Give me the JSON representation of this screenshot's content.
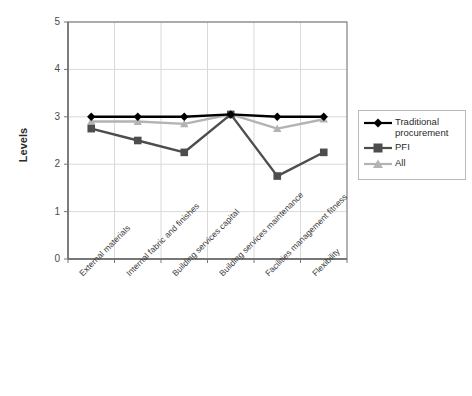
{
  "chart_data": {
    "type": "line",
    "title": "",
    "xlabel": "",
    "ylabel": "Levels",
    "ylim": [
      0,
      5
    ],
    "yticks": [
      "0",
      "1",
      "2",
      "3",
      "4",
      "5"
    ],
    "grid": true,
    "legend_position": "right",
    "categories": [
      "External materials",
      "Internal fabric and finishes",
      "Building services capital",
      "Building services maintenance",
      "Facilities management fitness",
      "Flexibility"
    ],
    "series": [
      {
        "name": "Traditional procurement",
        "marker": "diamond",
        "color": "#000000",
        "values": [
          3.0,
          3.0,
          3.0,
          3.05,
          3.0,
          3.0
        ]
      },
      {
        "name": "PFI",
        "marker": "square",
        "color": "#4d4d4d",
        "values": [
          2.75,
          2.5,
          2.25,
          3.05,
          1.75,
          2.25
        ]
      },
      {
        "name": "All",
        "marker": "triangle",
        "color": "#b3b3b3",
        "values": [
          2.9,
          2.9,
          2.85,
          3.05,
          2.75,
          2.95
        ]
      }
    ]
  },
  "legend": {
    "entries": [
      "Traditional procurement",
      "PFI",
      "All"
    ]
  },
  "colors": {
    "axis": "#808080",
    "grid": "#d9d9d9",
    "plot_background": "#ffffff",
    "traditional": "#000000",
    "pfi": "#4d4d4d",
    "all": "#b3b3b3"
  }
}
